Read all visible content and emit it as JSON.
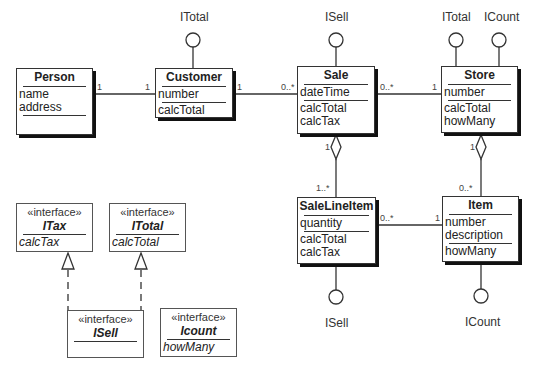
{
  "classes": {
    "person": {
      "name": "Person",
      "attributes": [
        "name",
        "address"
      ],
      "operations": []
    },
    "customer": {
      "name": "Customer",
      "attributes": [
        "number"
      ],
      "operations": [
        "calcTotal"
      ]
    },
    "sale": {
      "name": "Sale",
      "attributes": [
        "dateTime"
      ],
      "operations": [
        "calcTotal",
        "calcTax"
      ]
    },
    "store": {
      "name": "Store",
      "attributes": [
        "number"
      ],
      "operations": [
        "calcTotal",
        "howMany"
      ]
    },
    "salelineitem": {
      "name": "SaleLineItem",
      "attributes": [
        "quantity"
      ],
      "operations": [
        "calcTotal",
        "calcTax"
      ]
    },
    "item": {
      "name": "Item",
      "attributes": [
        "number",
        "description"
      ],
      "operations": [
        "howMany"
      ]
    }
  },
  "interfaces": {
    "itax": {
      "stereotype": "«interface»",
      "name": "ITax",
      "operations": [
        "calcTax"
      ]
    },
    "itotal": {
      "stereotype": "«interface»",
      "name": "ITotal",
      "operations": [
        "calcTotal"
      ]
    },
    "isell": {
      "stereotype": "«interface»",
      "name": "ISell",
      "operations": []
    },
    "icount": {
      "stereotype": "«interface»",
      "name": "Icount",
      "operations": [
        "howMany"
      ]
    }
  },
  "lollipops": {
    "customer_itotal": "ITotal",
    "sale_isell": "ISell",
    "store_itotal": "ITotal",
    "store_icount": "ICount",
    "salelineitem_isell": "ISell",
    "item_icount": "ICount"
  },
  "associations": {
    "person_customer": {
      "from": "Person",
      "to": "Customer",
      "from_mult": "1",
      "to_mult": "1"
    },
    "customer_sale": {
      "from": "Customer",
      "to": "Sale",
      "from_mult": "1",
      "to_mult": "0..*"
    },
    "sale_store": {
      "from": "Sale",
      "to": "Store",
      "from_mult": "0..*",
      "to_mult": "1"
    },
    "sale_salelineitem": {
      "from": "Sale",
      "to": "SaleLineItem",
      "from_mult": "1",
      "to_mult": "1..*",
      "kind": "aggregation"
    },
    "store_item": {
      "from": "Store",
      "to": "Item",
      "from_mult": "1",
      "to_mult": "0..*",
      "kind": "aggregation"
    },
    "salelineitem_item": {
      "from": "SaleLineItem",
      "to": "Item",
      "from_mult": "0..*",
      "to_mult": "1"
    }
  },
  "generalizations": [
    {
      "child": "ISell",
      "parent": "ITax"
    },
    {
      "child": "ISell",
      "parent": "ITotal"
    }
  ]
}
